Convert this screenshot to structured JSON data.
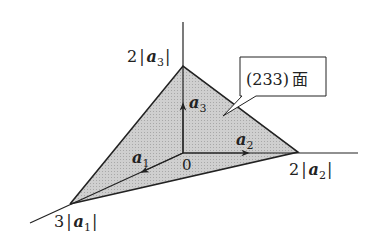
{
  "diagram": {
    "callout": {
      "text": "(233)",
      "suffix": "面"
    },
    "origin_label": "0",
    "vectors": [
      {
        "name": "a",
        "sub": "1"
      },
      {
        "name": "a",
        "sub": "2"
      },
      {
        "name": "a",
        "sub": "3"
      }
    ],
    "intercepts": [
      {
        "coef": "3",
        "vec": "a",
        "sub": "1"
      },
      {
        "coef": "2",
        "vec": "a",
        "sub": "2"
      },
      {
        "coef": "2",
        "vec": "a",
        "sub": "3"
      }
    ],
    "colors": {
      "plane_fill": "#c8c8c8",
      "line": "#222222"
    }
  }
}
